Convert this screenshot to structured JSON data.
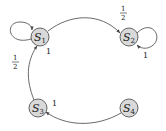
{
  "diagram": {
    "type": "state-transition-graph",
    "nodes": [
      {
        "id": "S1",
        "letter": "S",
        "sub": "1",
        "cx": 40,
        "cy": 37
      },
      {
        "id": "S2",
        "letter": "S",
        "sub": "2",
        "cx": 129,
        "cy": 37
      },
      {
        "id": "S3",
        "letter": "S",
        "sub": "3",
        "cx": 38,
        "cy": 108
      },
      {
        "id": "S4",
        "letter": "S",
        "sub": "4",
        "cx": 129,
        "cy": 108
      }
    ],
    "edges": [
      {
        "from": "S1",
        "to": "S1",
        "label_num": "1",
        "label_den": "2",
        "kind": "self-loop"
      },
      {
        "from": "S1",
        "to": "S2",
        "label_num": "1",
        "label_den": "2",
        "kind": "arc"
      },
      {
        "from": "S2",
        "to": "S2",
        "label": "1",
        "kind": "self-loop"
      },
      {
        "from": "S3",
        "to": "S1",
        "label": "1",
        "kind": "arc"
      },
      {
        "from": "S4",
        "to": "S3",
        "label": "1",
        "kind": "arc"
      }
    ]
  },
  "colors": {
    "node_fill": "#d9d9d9",
    "node_stroke": "#555555",
    "edge": "#444444",
    "text": "#222222"
  }
}
